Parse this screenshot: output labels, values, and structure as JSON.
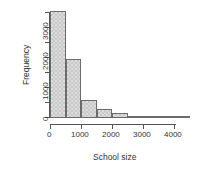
{
  "chart_data": {
    "type": "bar",
    "title": "",
    "subtitle": "",
    "xlabel": "School size",
    "ylabel": "Frequency",
    "grid": false,
    "legend": "none",
    "binwidth": 500,
    "xlim": [
      0,
      4500
    ],
    "ylim": [
      0,
      3600
    ],
    "x_ticks": [
      0,
      1000,
      2000,
      3000,
      4000
    ],
    "x_tick_labels": [
      "0",
      "1000",
      "2000",
      "3000",
      "4000"
    ],
    "y_ticks": [
      0,
      500,
      1000,
      1500,
      2000,
      2500,
      3000,
      3500
    ],
    "y_tick_labels": [
      "0",
      "",
      "1000",
      "",
      "2000",
      "",
      "3000",
      ""
    ],
    "categories": [
      "0-500",
      "500-1000",
      "1000-1500",
      "1500-2000",
      "2000-2500",
      "2500-3000",
      "3000-3500",
      "3500-4000",
      "4000-4500"
    ],
    "bin_starts": [
      0,
      500,
      1000,
      1500,
      2000,
      2500,
      3000,
      3500,
      4000
    ],
    "bin_ends": [
      500,
      1000,
      1500,
      2000,
      2500,
      3000,
      3500,
      4000,
      4500
    ],
    "values": [
      3550,
      1950,
      560,
      260,
      130,
      40,
      20,
      10,
      5
    ],
    "bar_fill": "#c9c9c9",
    "bar_border": "#6b6b6b",
    "axis_color": "#555555"
  }
}
